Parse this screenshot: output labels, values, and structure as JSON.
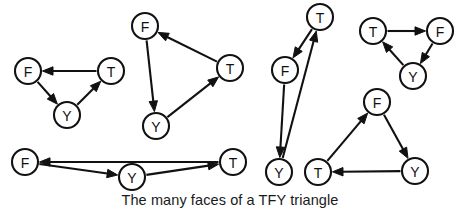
{
  "figure": {
    "caption": "The many faces of a TFY triangle",
    "caption_position": {
      "x": 230,
      "y": 205
    },
    "node_radius": 13,
    "colors": {
      "ink": "#111111",
      "node_fill": "#ffffff",
      "background": "#ffffff",
      "caption": "#1a1a1a"
    },
    "diagrams": [
      {
        "name": "triangle-1",
        "nodes": [
          {
            "id": "F1",
            "label": "F",
            "x": 28,
            "y": 71
          },
          {
            "id": "T1",
            "label": "T",
            "x": 111,
            "y": 71
          },
          {
            "id": "Y1",
            "label": "Y",
            "x": 67,
            "y": 115
          }
        ],
        "edges": [
          {
            "from": "T1",
            "to": "F1"
          },
          {
            "from": "F1",
            "to": "Y1"
          },
          {
            "from": "Y1",
            "to": "T1"
          }
        ]
      },
      {
        "name": "triangle-2",
        "nodes": [
          {
            "id": "F2",
            "label": "F",
            "x": 145,
            "y": 26
          },
          {
            "id": "T2",
            "label": "T",
            "x": 230,
            "y": 68
          },
          {
            "id": "Y2",
            "label": "Y",
            "x": 156,
            "y": 126
          }
        ],
        "edges": [
          {
            "from": "T2",
            "to": "F2"
          },
          {
            "from": "F2",
            "to": "Y2"
          },
          {
            "from": "Y2",
            "to": "T2"
          }
        ]
      },
      {
        "name": "triangle-3",
        "nodes": [
          {
            "id": "F3",
            "label": "F",
            "x": 25,
            "y": 162
          },
          {
            "id": "T3",
            "label": "T",
            "x": 233,
            "y": 162
          },
          {
            "id": "Y3",
            "label": "Y",
            "x": 132,
            "y": 177
          }
        ],
        "edges": [
          {
            "from": "T3",
            "to": "F3"
          },
          {
            "from": "F3",
            "to": "Y3"
          },
          {
            "from": "Y3",
            "to": "T3"
          }
        ]
      },
      {
        "name": "triangle-4",
        "nodes": [
          {
            "id": "T4",
            "label": "T",
            "x": 320,
            "y": 17
          },
          {
            "id": "F4",
            "label": "F",
            "x": 285,
            "y": 70
          },
          {
            "id": "Y4",
            "label": "Y",
            "x": 279,
            "y": 172
          }
        ],
        "edges": [
          {
            "from": "T4",
            "to": "F4"
          },
          {
            "from": "F4",
            "to": "Y4"
          },
          {
            "from": "Y4",
            "to": "T4"
          }
        ]
      },
      {
        "name": "triangle-5",
        "nodes": [
          {
            "id": "T5",
            "label": "T",
            "x": 373,
            "y": 31
          },
          {
            "id": "F5",
            "label": "F",
            "x": 440,
            "y": 31
          },
          {
            "id": "Y5",
            "label": "Y",
            "x": 413,
            "y": 76
          }
        ],
        "edges": [
          {
            "from": "T5",
            "to": "F5"
          },
          {
            "from": "F5",
            "to": "Y5"
          },
          {
            "from": "Y5",
            "to": "T5"
          }
        ]
      },
      {
        "name": "triangle-6",
        "nodes": [
          {
            "id": "F6",
            "label": "F",
            "x": 377,
            "y": 102
          },
          {
            "id": "Y6",
            "label": "Y",
            "x": 415,
            "y": 171
          },
          {
            "id": "T6",
            "label": "T",
            "x": 318,
            "y": 172
          }
        ],
        "edges": [
          {
            "from": "T6",
            "to": "F6"
          },
          {
            "from": "F6",
            "to": "Y6"
          },
          {
            "from": "Y6",
            "to": "T6"
          }
        ]
      }
    ]
  }
}
